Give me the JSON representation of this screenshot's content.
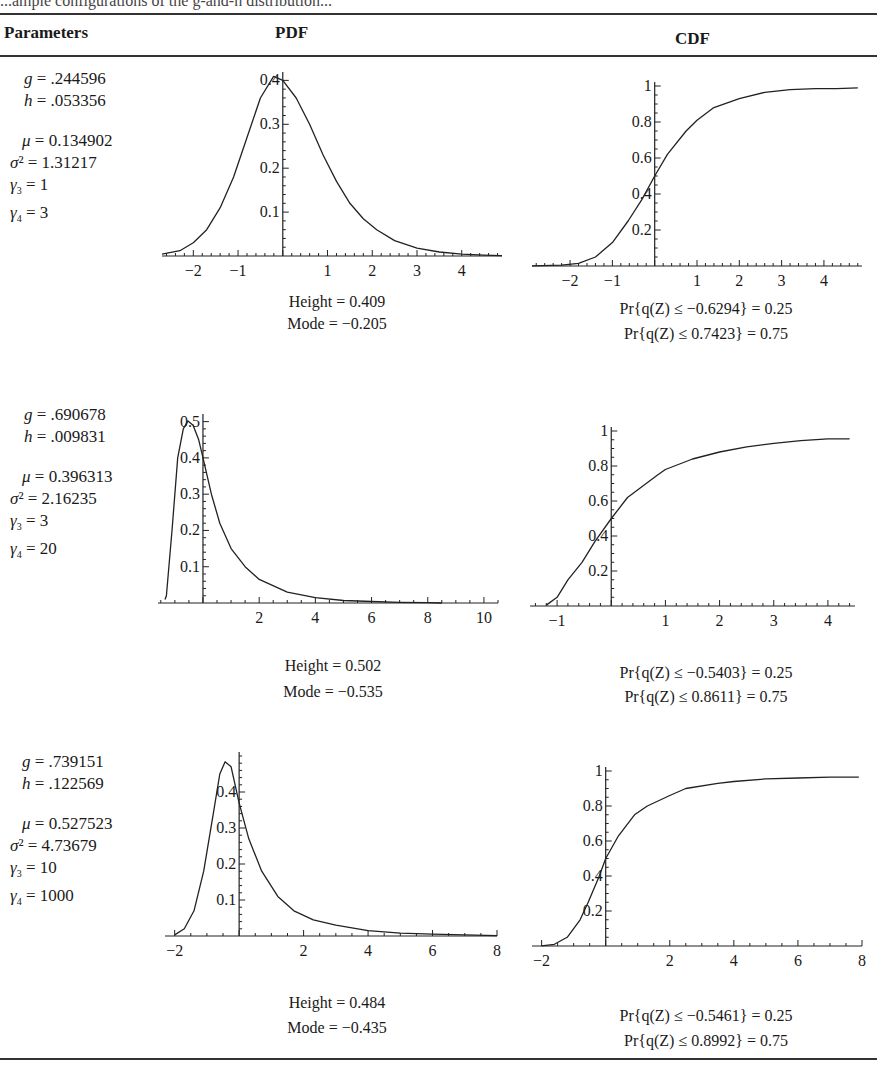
{
  "caption_fragment": "...ample configurations of the g-and-h distribution...",
  "table": {
    "headers": {
      "parameters": "Parameters",
      "pdf": "PDF",
      "cdf": "CDF"
    },
    "rows": [
      {
        "params": {
          "g": ".244596",
          "h": ".053356",
          "mu": "0.134902",
          "sigma2": "1.31217",
          "gamma3": "1",
          "gamma4": "3"
        },
        "pdf_stats": {
          "height": "Height = 0.409",
          "mode": "Mode = −0.205"
        },
        "cdf_stats": {
          "q25": "Pr{q(Z) ≤ −0.6294} = 0.25",
          "q75": "Pr{q(Z) ≤ 0.7423} = 0.75"
        }
      },
      {
        "params": {
          "g": ".690678",
          "h": ".009831",
          "mu": "0.396313",
          "sigma2": "2.16235",
          "gamma3": "3",
          "gamma4": "20"
        },
        "pdf_stats": {
          "height": "Height = 0.502",
          "mode": "Mode = −0.535"
        },
        "cdf_stats": {
          "q25": "Pr{q(Z) ≤ −0.5403} = 0.25",
          "q75": "Pr{q(Z) ≤ 0.8611} = 0.75"
        }
      },
      {
        "params": {
          "g": ".739151",
          "h": ".122569",
          "mu": "0.527523",
          "sigma2": "4.73679",
          "gamma3": "10",
          "gamma4": "1000"
        },
        "pdf_stats": {
          "height": "Height = 0.484",
          "mode": "Mode = −0.435"
        },
        "cdf_stats": {
          "q25": "Pr{q(Z) ≤ −0.5461} = 0.25",
          "q75": "Pr{q(Z) ≤ 0.8992} = 0.75"
        }
      }
    ]
  },
  "chart_data": [
    {
      "id": "pdf1",
      "type": "line",
      "title": "PDF",
      "xlim": [
        -2.7,
        4.9
      ],
      "ylim": [
        0,
        0.41
      ],
      "xticks": [
        -2,
        -1,
        1,
        2,
        3,
        4
      ],
      "yticks": [
        0.1,
        0.2,
        0.3,
        0.4
      ],
      "x": [
        -2.7,
        -2.3,
        -2,
        -1.7,
        -1.4,
        -1.1,
        -0.8,
        -0.5,
        -0.205,
        0,
        0.3,
        0.6,
        0.9,
        1.2,
        1.5,
        1.8,
        2.1,
        2.5,
        3,
        3.5,
        4,
        4.5,
        4.9
      ],
      "y": [
        0.004,
        0.012,
        0.03,
        0.06,
        0.11,
        0.18,
        0.27,
        0.36,
        0.409,
        0.4,
        0.36,
        0.3,
        0.23,
        0.17,
        0.12,
        0.085,
        0.06,
        0.035,
        0.018,
        0.009,
        0.004,
        0.002,
        0.001
      ]
    },
    {
      "id": "cdf1",
      "type": "line",
      "title": "CDF",
      "xlim": [
        -2.9,
        4.9
      ],
      "ylim": [
        0,
        1
      ],
      "xticks": [
        -2,
        -1,
        1,
        2,
        3,
        4
      ],
      "yticks": [
        0.2,
        0.4,
        0.6,
        0.8,
        1
      ],
      "x": [
        -2.9,
        -2.2,
        -1.8,
        -1.4,
        -1,
        -0.6294,
        -0.3,
        0,
        0.3,
        0.7423,
        1,
        1.4,
        2,
        2.6,
        3.2,
        3.8,
        4.3,
        4.8
      ],
      "y": [
        0.001,
        0.005,
        0.015,
        0.05,
        0.13,
        0.25,
        0.37,
        0.5,
        0.62,
        0.75,
        0.81,
        0.88,
        0.93,
        0.965,
        0.98,
        0.985,
        0.985,
        0.99
      ]
    },
    {
      "id": "pdf2",
      "type": "line",
      "title": "PDF",
      "xlim": [
        -1.6,
        10.5
      ],
      "ylim": [
        0,
        0.51
      ],
      "xticks": [
        2,
        4,
        6,
        8,
        10
      ],
      "yticks": [
        0.1,
        0.2,
        0.3,
        0.4,
        0.5
      ],
      "x": [
        -1.35,
        -1.3,
        -1.1,
        -0.9,
        -0.7,
        -0.535,
        -0.35,
        -0.15,
        0,
        0.3,
        0.6,
        1,
        1.5,
        2,
        3,
        4,
        5,
        6,
        7,
        8,
        8.5
      ],
      "y": [
        0.01,
        0.02,
        0.2,
        0.4,
        0.48,
        0.502,
        0.49,
        0.45,
        0.4,
        0.3,
        0.22,
        0.15,
        0.1,
        0.065,
        0.03,
        0.015,
        0.007,
        0.004,
        0.002,
        0.001,
        0
      ]
    },
    {
      "id": "cdf2",
      "type": "line",
      "title": "CDF",
      "xlim": [
        -1.5,
        4.5
      ],
      "ylim": [
        0,
        1
      ],
      "xticks": [
        -1,
        1,
        2,
        3,
        4
      ],
      "yticks": [
        0.2,
        0.4,
        0.6,
        0.8,
        1
      ],
      "x": [
        -1.2,
        -1,
        -0.8,
        -0.5403,
        -0.3,
        0,
        0.3,
        0.8611,
        1,
        1.5,
        2,
        2.5,
        3,
        3.5,
        4,
        4.4
      ],
      "y": [
        0.005,
        0.05,
        0.15,
        0.25,
        0.37,
        0.5,
        0.62,
        0.75,
        0.78,
        0.84,
        0.88,
        0.91,
        0.93,
        0.945,
        0.955,
        0.955
      ]
    },
    {
      "id": "pdf3",
      "type": "line",
      "title": "PDF",
      "xlim": [
        -2.3,
        8
      ],
      "ylim": [
        0,
        0.5
      ],
      "xticks": [
        -2,
        2,
        4,
        6,
        8
      ],
      "yticks": [
        0.1,
        0.2,
        0.3,
        0.4
      ],
      "x": [
        -2,
        -1.7,
        -1.4,
        -1.1,
        -0.8,
        -0.6,
        -0.435,
        -0.25,
        0,
        0.3,
        0.7,
        1.2,
        1.7,
        2.3,
        3,
        4,
        5,
        6,
        7,
        8
      ],
      "y": [
        0.003,
        0.02,
        0.07,
        0.18,
        0.34,
        0.45,
        0.484,
        0.47,
        0.37,
        0.27,
        0.18,
        0.11,
        0.07,
        0.045,
        0.03,
        0.015,
        0.008,
        0.005,
        0.003,
        0.001
      ]
    },
    {
      "id": "cdf3",
      "type": "line",
      "title": "CDF",
      "xlim": [
        -2.3,
        8
      ],
      "ylim": [
        0,
        1
      ],
      "xticks": [
        -2,
        2,
        4,
        6,
        8
      ],
      "yticks": [
        0.2,
        0.4,
        0.6,
        0.8,
        1
      ],
      "x": [
        -2,
        -1.6,
        -1.2,
        -0.8,
        -0.5461,
        -0.2,
        0,
        0.4,
        0.8992,
        1.3,
        2,
        2.5,
        3.5,
        4,
        5,
        6,
        7,
        7.9
      ],
      "y": [
        0.001,
        0.01,
        0.05,
        0.15,
        0.25,
        0.4,
        0.5,
        0.63,
        0.75,
        0.8,
        0.86,
        0.9,
        0.93,
        0.94,
        0.955,
        0.96,
        0.965,
        0.965
      ]
    }
  ]
}
